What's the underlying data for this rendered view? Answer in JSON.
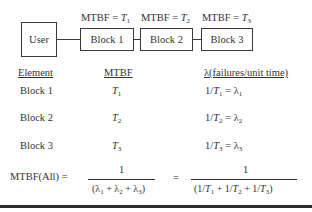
{
  "diagram": {
    "nodes": [
      {
        "id": "user",
        "label": "User"
      },
      {
        "id": "block1",
        "label": "Block 1",
        "annotation": {
          "prefix": "MTBF = ",
          "var": "T",
          "sub": "1"
        }
      },
      {
        "id": "block2",
        "label": "Block 2",
        "annotation": {
          "prefix": "MTBF = ",
          "var": "T",
          "sub": "2"
        }
      },
      {
        "id": "block3",
        "label": "Block 3",
        "annotation": {
          "prefix": "MTBF = ",
          "var": "T",
          "sub": "3"
        }
      }
    ],
    "edges": [
      [
        "user",
        "block1"
      ],
      [
        "block1",
        "block2"
      ],
      [
        "block2",
        "block3"
      ]
    ]
  },
  "table": {
    "headers": [
      "Element",
      "MTBF",
      "λ(failures/unit time)"
    ],
    "rows": [
      {
        "element": "Block 1",
        "mtbf_var": "T",
        "mtbf_sub": "1",
        "lambda_pre": "1/",
        "lambda_var": "T",
        "lambda_sub": "1",
        "lambda_eq": " = λ",
        "lambda_res_sub": "1"
      },
      {
        "element": "Block 2",
        "mtbf_var": "T",
        "mtbf_sub": "2",
        "lambda_pre": "1/",
        "lambda_var": "T",
        "lambda_sub": "2",
        "lambda_eq": " = λ",
        "lambda_res_sub": "2"
      },
      {
        "element": "Block 3",
        "mtbf_var": "T",
        "mtbf_sub": "3",
        "lambda_pre": "1/",
        "lambda_var": "T",
        "lambda_sub": "3",
        "lambda_eq": " = λ",
        "lambda_res_sub": "3"
      }
    ]
  },
  "formula": {
    "lhs": "MTBF(All) =",
    "frac1": {
      "numerator": "1",
      "denominator": "(λ1 + λ2 + λ3)"
    },
    "equals": "=",
    "frac2": {
      "numerator": "1",
      "denominator": "(1/T1 + 1/T2 + 1/T3)"
    }
  }
}
